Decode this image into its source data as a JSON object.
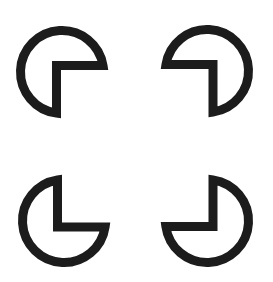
{
  "figure": {
    "title": "",
    "background": "#ffffff",
    "stroke_color": "#1c1c1c",
    "stroke_width": 9,
    "radius": 41.5,
    "shapes": [
      {
        "id": "top-left",
        "center": [
          62,
          72
        ],
        "vertex": [
          56.5,
          65.5
        ],
        "notch": "bottom-right"
      },
      {
        "id": "top-right",
        "center": [
          207,
          71
        ],
        "vertex": [
          213,
          64.5
        ],
        "notch": "bottom-left"
      },
      {
        "id": "bottom-left",
        "center": [
          64,
          221
        ],
        "vertex": [
          57.5,
          227
        ],
        "notch": "top-right"
      },
      {
        "id": "bottom-right",
        "center": [
          207,
          221
        ],
        "vertex": [
          213,
          226.5
        ],
        "notch": "top-left"
      }
    ]
  }
}
